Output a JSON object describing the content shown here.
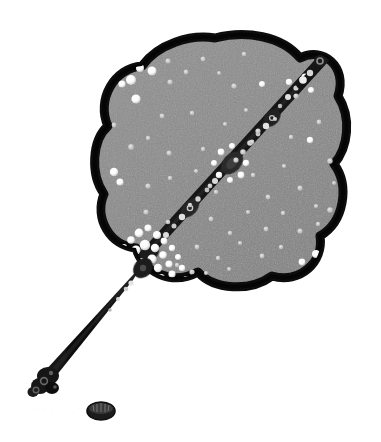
{
  "image": {
    "title": "Grayscale specimen micrograph",
    "background_color": "#ffffff",
    "width": 381,
    "height": 442
  },
  "palette": {
    "background": "#ffffff",
    "body_fill": "#8a8a8a",
    "body_fill_light": "#949494",
    "body_fill_dark": "#7e7e7e",
    "outline": "#0d0d0d",
    "strand_dark": "#151515",
    "handle_dark": "#111111",
    "speck_white": "#ffffff",
    "speck_dim": "#d8d8d8",
    "bead_mid": "#5a5a5a",
    "faint_text": "#f2f2f2"
  },
  "structures": {
    "body": {
      "name": "lobed-grey-body",
      "description": "Large scalloped four-lobed grey mass with thick black outline",
      "center_x": 215,
      "center_y": 165,
      "radius_x": 118,
      "radius_y": 122,
      "outline_width": 9,
      "lobes": 4
    },
    "strand": {
      "name": "beaded-diagonal-strand",
      "description": "Dark beaded band crossing the body from lower-left to upper-right",
      "start_x": 128,
      "start_y": 272,
      "end_x": 320,
      "end_y": 62,
      "width": 11,
      "bead_count": 22
    },
    "handle": {
      "name": "handle-shaft",
      "description": "Long dark tapering shaft extending to the lower left",
      "start_x": 132,
      "start_y": 272,
      "end_x": 48,
      "end_y": 378,
      "width_top": 13,
      "width_bottom": 8
    },
    "handle_tip": {
      "name": "handle-tip-knob",
      "description": "Rounded knob cluster with small rings at the shaft terminus",
      "x": 44,
      "y": 383,
      "radius": 13
    },
    "top_knob": {
      "name": "strand-top-knob",
      "description": "Small circular knob capping the strand at upper right",
      "x": 320,
      "y": 61,
      "radius": 6
    },
    "loose_ellipse": {
      "name": "detached-ellipse",
      "description": "Small isolated dark ribbed ellipse below the handle",
      "x": 101,
      "y": 410,
      "radius_x": 14,
      "radius_y": 9
    },
    "clusters": [
      {
        "name": "lower-left-speck-burst",
        "x": 152,
        "y": 255,
        "radius": 34,
        "count": 40,
        "brightness": "bright"
      },
      {
        "name": "upper-left-rim-specks",
        "x": 133,
        "y": 78,
        "radius": 16,
        "count": 9,
        "brightness": "bright"
      },
      {
        "name": "central-node-specks",
        "x": 232,
        "y": 163,
        "radius": 16,
        "count": 12,
        "brightness": "bright"
      },
      {
        "name": "upper-right-rim-specks",
        "x": 300,
        "y": 82,
        "radius": 16,
        "count": 8,
        "brightness": "dim"
      },
      {
        "name": "lower-right-rim-specks",
        "x": 318,
        "y": 258,
        "radius": 12,
        "count": 6,
        "brightness": "bright"
      }
    ]
  },
  "annotations": {
    "faint_marks": "· · · · · ·"
  },
  "chart_data": {
    "type": "scatter",
    "xlabel": "",
    "ylabel": "",
    "xlim": [
      0,
      381
    ],
    "ylim": [
      442,
      0
    ],
    "grid": false,
    "legend": null,
    "series": [
      {
        "name": "scattered-white-specks",
        "marker": "circle",
        "color": "#ffffff",
        "points": [
          [
            140,
            68,
            4.0
          ],
          [
            152,
            71,
            4.5
          ],
          [
            131,
            80,
            5.0
          ],
          [
            122,
            84,
            3.6
          ],
          [
            168,
            61,
            2.6
          ],
          [
            186,
            72,
            2.4
          ],
          [
            170,
            82,
            2.6
          ],
          [
            203,
            59,
            2.4
          ],
          [
            244,
            54,
            2.2
          ],
          [
            234,
            86,
            2.6
          ],
          [
            219,
            73,
            1.9
          ],
          [
            262,
            84,
            3.0
          ],
          [
            289,
            82,
            3.2
          ],
          [
            305,
            77,
            3.6
          ],
          [
            311,
            90,
            3.0
          ],
          [
            296,
            96,
            2.6
          ],
          [
            136,
            99,
            4.6
          ],
          [
            114,
            125,
            2.4
          ],
          [
            162,
            116,
            2.4
          ],
          [
            192,
            113,
            2.3
          ],
          [
            148,
            138,
            2.2
          ],
          [
            131,
            147,
            2.9
          ],
          [
            169,
            153,
            2.5
          ],
          [
            203,
            149,
            2.2
          ],
          [
            225,
            124,
            2.1
          ],
          [
            246,
            110,
            2.0
          ],
          [
            258,
            131,
            2.6
          ],
          [
            275,
            119,
            2.1
          ],
          [
            291,
            137,
            2.2
          ],
          [
            310,
            140,
            3.2
          ],
          [
            319,
            122,
            2.4
          ],
          [
            330,
            161,
            2.7
          ],
          [
            114,
            172,
            4.2
          ],
          [
            120,
            182,
            3.6
          ],
          [
            148,
            186,
            2.6
          ],
          [
            170,
            178,
            2.2
          ],
          [
            196,
            171,
            2.1
          ],
          [
            216,
            192,
            2.2
          ],
          [
            236,
            160,
            2.6
          ],
          [
            253,
            175,
            2.2
          ],
          [
            268,
            197,
            2.4
          ],
          [
            284,
            166,
            2.1
          ],
          [
            300,
            188,
            2.6
          ],
          [
            316,
            206,
            2.1
          ],
          [
            334,
            183,
            2.0
          ],
          [
            146,
            212,
            2.6
          ],
          [
            168,
            222,
            2.3
          ],
          [
            190,
            205,
            2.2
          ],
          [
            211,
            219,
            2.4
          ],
          [
            230,
            233,
            2.2
          ],
          [
            248,
            212,
            2.1
          ],
          [
            266,
            229,
            2.4
          ],
          [
            283,
            213,
            2.2
          ],
          [
            300,
            231,
            2.6
          ],
          [
            318,
            224,
            2.2
          ],
          [
            330,
            210,
            2.8
          ],
          [
            197,
            247,
            2.4
          ],
          [
            218,
            258,
            2.2
          ],
          [
            240,
            243,
            2.1
          ],
          [
            262,
            256,
            2.4
          ],
          [
            281,
            247,
            2.2
          ],
          [
            302,
            262,
            3.4
          ],
          [
            316,
            254,
            4.0
          ],
          [
            324,
            266,
            3.0
          ],
          [
            177,
            265,
            2.2
          ],
          [
            206,
            273,
            2.0
          ],
          [
            229,
            269,
            2.0
          ]
        ]
      },
      {
        "name": "lower-left-burst",
        "marker": "circle",
        "color": "#ffffff",
        "points": [
          [
            131,
            240,
            3.8
          ],
          [
            139,
            233,
            4.4
          ],
          [
            148,
            228,
            3.6
          ],
          [
            157,
            235,
            4.0
          ],
          [
            136,
            250,
            4.6
          ],
          [
            145,
            245,
            5.2
          ],
          [
            155,
            248,
            4.2
          ],
          [
            164,
            241,
            3.4
          ],
          [
            128,
            256,
            3.6
          ],
          [
            141,
            262,
            4.0
          ],
          [
            152,
            259,
            4.6
          ],
          [
            163,
            255,
            3.8
          ],
          [
            172,
            248,
            3.2
          ],
          [
            134,
            268,
            3.4
          ],
          [
            147,
            272,
            3.8
          ],
          [
            158,
            268,
            4.2
          ],
          [
            169,
            264,
            3.6
          ],
          [
            178,
            257,
            3.0
          ],
          [
            150,
            281,
            3.4
          ],
          [
            161,
            278,
            4.0
          ],
          [
            172,
            274,
            3.6
          ],
          [
            182,
            268,
            3.2
          ],
          [
            163,
            289,
            3.2
          ],
          [
            175,
            285,
            3.6
          ],
          [
            186,
            279,
            3.0
          ],
          [
            124,
            247,
            3.0
          ],
          [
            120,
            259,
            2.8
          ],
          [
            192,
            272,
            2.6
          ],
          [
            188,
            289,
            2.8
          ],
          [
            176,
            296,
            2.6
          ],
          [
            166,
            299,
            2.4
          ]
        ]
      },
      {
        "name": "central-node-halo",
        "marker": "circle",
        "color": "#ffffff",
        "points": [
          [
            221,
            152,
            3.4
          ],
          [
            232,
            146,
            3.0
          ],
          [
            243,
            152,
            2.8
          ],
          [
            246,
            163,
            3.2
          ],
          [
            241,
            175,
            3.4
          ],
          [
            230,
            180,
            3.0
          ],
          [
            219,
            175,
            3.2
          ],
          [
            214,
            163,
            3.0
          ],
          [
            252,
            142,
            2.4
          ],
          [
            210,
            186,
            2.4
          ]
        ]
      }
    ]
  }
}
